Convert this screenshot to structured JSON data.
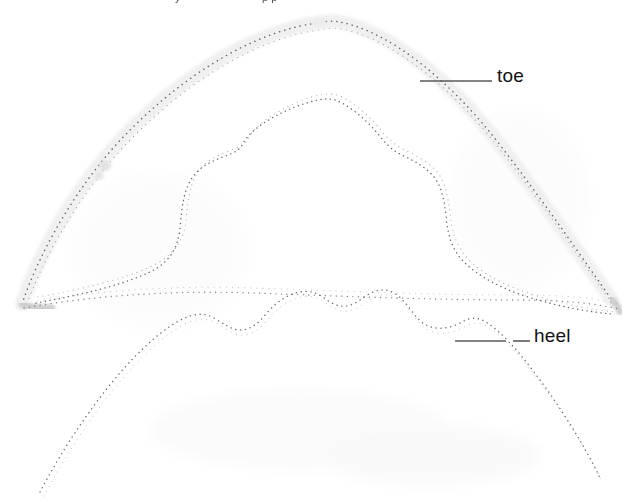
{
  "image": {
    "kind": "scanned-pattern-diagram",
    "subject": "knitted sock / foot covering flattened outline tracing",
    "width": 643,
    "height": 502,
    "background_color": "#ffffff",
    "ink_color": "#4a4a52",
    "faint_band_color": "#eeeeee",
    "leader_line_color": "#555555",
    "label_text_color": "#111111"
  },
  "labels": {
    "toe": "toe",
    "heel": "heel"
  },
  "cut_off_top_text": {
    "fragment_a": "y",
    "fragment_b": "p p"
  },
  "annotations": [
    {
      "name": "toe",
      "text": "toe",
      "text_x": 497,
      "text_y": 66,
      "leader": {
        "x1": 420,
        "y1": 81,
        "x2": 492,
        "y2": 81
      }
    },
    {
      "name": "heel",
      "text": "heel",
      "text_x": 534,
      "text_y": 326,
      "leader_segments": [
        {
          "x1": 455,
          "y1": 341,
          "x2": 506,
          "y2": 341
        },
        {
          "x1": 513,
          "y1": 341,
          "x2": 530,
          "y2": 341
        }
      ]
    }
  ],
  "contours": [
    {
      "name": "outer-toe-arc",
      "style": "faint grey band with fine dotted stitch line",
      "description": "large arching outline spanning the full width, apex near top centre"
    },
    {
      "name": "middle-contour",
      "style": "double fine dotted line",
      "description": "inner lobed outline with shoulder notches on both sides"
    },
    {
      "name": "inner-heel-contour",
      "style": "fine dotted line",
      "description": "lower broad arch forming the heel section"
    }
  ]
}
